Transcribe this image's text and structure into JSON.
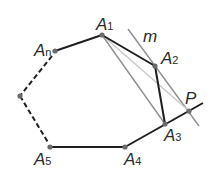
{
  "diagram": {
    "points": {
      "A1": {
        "label": "A",
        "sub": "1",
        "x": 102,
        "y": 35
      },
      "A2": {
        "label": "A",
        "sub": "2",
        "x": 155,
        "y": 66
      },
      "A3": {
        "label": "A",
        "sub": "3",
        "x": 165,
        "y": 124
      },
      "A4": {
        "label": "A",
        "sub": "4",
        "x": 125,
        "y": 147
      },
      "A5": {
        "label": "A",
        "sub": "5",
        "x": 50,
        "y": 147
      },
      "An": {
        "label": "A",
        "sub": "n",
        "x": 55,
        "y": 51
      },
      "V": {
        "x": 20,
        "y": 96
      },
      "P": {
        "label": "P",
        "x": 189,
        "y": 111
      }
    },
    "line_label": "m",
    "colors": {
      "edge": "#1f1f1f",
      "point": "#6b6b6b",
      "gray_line": "#8a8a8a",
      "light_line": "#c4c4c4"
    }
  }
}
